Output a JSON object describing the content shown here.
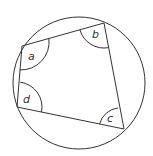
{
  "diagram": {
    "circle": {
      "cx": 79,
      "cy": 83,
      "r": 66
    },
    "vertices": {
      "a": {
        "x": 22,
        "y": 46
      },
      "b": {
        "x": 104,
        "y": 23
      },
      "c": {
        "x": 124,
        "y": 129
      },
      "d": {
        "x": 17,
        "y": 107
      }
    },
    "angle_labels": {
      "a": "a",
      "b": "b",
      "c": "c",
      "d": "d"
    },
    "stroke_color": "#333333",
    "background": "#ffffff"
  }
}
